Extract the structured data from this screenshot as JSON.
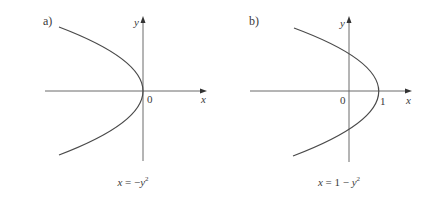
{
  "figure": {
    "panels": [
      {
        "id": "a",
        "label": "a)",
        "x_axis_label": "x",
        "y_axis_label": "y",
        "origin_label": "0",
        "caption": {
          "lhs": "x",
          "eq": " = ",
          "rhs_prefix": "−",
          "rhs_var": "y",
          "rhs_exp": "2"
        },
        "equation": "x = −y²"
      },
      {
        "id": "b",
        "label": "b)",
        "x_axis_label": "x",
        "y_axis_label": "y",
        "origin_label": "0",
        "vertex_label": "1",
        "caption": {
          "lhs": "x",
          "eq": " = ",
          "rhs_prefix": "1 − ",
          "rhs_var": "y",
          "rhs_exp": "2"
        },
        "equation": "x = 1 − y²"
      }
    ]
  },
  "colors": {
    "axis": "#6b6b6b",
    "curve": "#4a4a4a",
    "text": "#3a3a3a",
    "background": "#ffffff"
  }
}
